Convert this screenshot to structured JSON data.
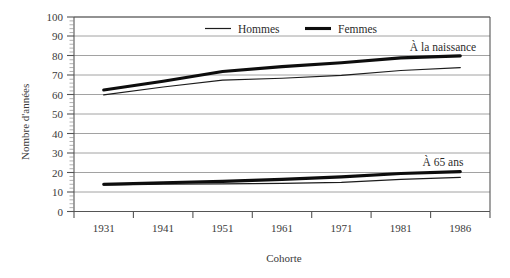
{
  "chart_data": {
    "type": "line",
    "title": "",
    "xlabel": "Cohorte",
    "ylabel": "Nombre d'années",
    "categories": [
      "1931",
      "1941",
      "1951",
      "1961",
      "1971",
      "1981",
      "1986"
    ],
    "ylim": [
      0,
      100
    ],
    "ytick_labels": [
      "0",
      "10",
      "20",
      "30",
      "40",
      "50",
      "60",
      "70",
      "80",
      "90",
      "100"
    ],
    "ytick_values": [
      0,
      10,
      20,
      30,
      40,
      50,
      60,
      70,
      80,
      90,
      100
    ],
    "grid": "horizontal",
    "legend_position": "top-center-inside",
    "legend": [
      {
        "name": "Hommes",
        "style": "thin-line"
      },
      {
        "name": "Femmes",
        "style": "thick-line"
      }
    ],
    "annotations": [
      {
        "text": "À la naissance",
        "near": "upper group"
      },
      {
        "text": "À 65 ans",
        "near": "lower group"
      }
    ],
    "groups": [
      {
        "name": "À la naissance",
        "series": [
          {
            "name": "Hommes",
            "style": "thin-line",
            "values": [
              60.0,
              64.0,
              67.5,
              68.5,
              70.0,
              72.5,
              74.0
            ]
          },
          {
            "name": "Femmes",
            "style": "thick-line",
            "values": [
              62.5,
              67.0,
              72.0,
              74.5,
              76.5,
              79.0,
              80.0
            ]
          }
        ]
      },
      {
        "name": "À 65 ans",
        "series": [
          {
            "name": "Hommes",
            "style": "thin-line",
            "values": [
              13.5,
              14.0,
              14.2,
              14.5,
              15.0,
              16.5,
              17.5
            ]
          },
          {
            "name": "Femmes",
            "style": "thick-line",
            "values": [
              14.0,
              14.8,
              15.5,
              16.5,
              17.8,
              19.5,
              20.5
            ]
          }
        ]
      }
    ]
  },
  "legend": {
    "hommes": "Hommes",
    "femmes": "Femmes"
  },
  "annotations": {
    "naissance": "À la naissance",
    "ans65": "À 65 ans"
  },
  "axes": {
    "ylabel": "Nombre d'années",
    "xlabel": "Cohorte",
    "yticks": [
      "100",
      "90",
      "80",
      "70",
      "60",
      "50",
      "40",
      "30",
      "20",
      "10",
      "0"
    ],
    "xticks": [
      "1931",
      "1941",
      "1951",
      "1961",
      "1971",
      "1981",
      "1986"
    ]
  }
}
